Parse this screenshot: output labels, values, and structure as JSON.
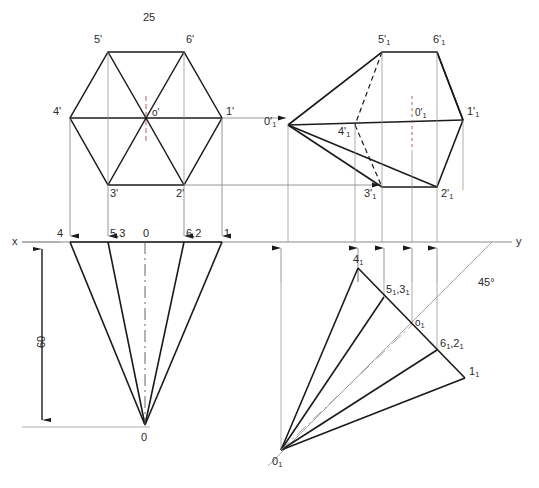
{
  "drawing": {
    "title_dimension": "25",
    "height_dimension": "60",
    "angle_note": "45°",
    "axes": {
      "x_label": "x",
      "y_label": "y",
      "x_axis_y": 242,
      "y_axis_x_end": 512
    },
    "colors": {
      "object_line": "#1a1a1a",
      "thin_line": "#808080",
      "center_line": "#555555",
      "hidden_line": "#1a1a1a",
      "text": "#2b2b2b",
      "background": "#ffffff"
    },
    "views": [
      {
        "name": "front-view-hexagon",
        "type": "hexagon",
        "center": {
          "x": 146,
          "y": 118,
          "label": "o'"
        },
        "vertices": [
          {
            "label": "1'",
            "x": 222,
            "y": 118,
            "lx": 226,
            "ly": 108
          },
          {
            "label": "2'",
            "x": 184,
            "y": 185,
            "lx": 176,
            "ly": 190
          },
          {
            "label": "3'",
            "x": 108,
            "y": 185,
            "lx": 110,
            "ly": 190
          },
          {
            "label": "4'",
            "x": 70,
            "y": 118,
            "lx": 53,
            "ly": 108
          },
          {
            "label": "5'",
            "x": 108,
            "y": 52,
            "lx": 94,
            "ly": 36
          },
          {
            "label": "6'",
            "x": 184,
            "y": 52,
            "lx": 186,
            "ly": 36
          }
        ]
      },
      {
        "name": "top-view-fan-left",
        "type": "cone-fan",
        "apex": {
          "label": "0",
          "x": 145,
          "y": 425,
          "lx": 141,
          "ly": 432
        },
        "base_points": [
          {
            "label": "4",
            "x": 70,
            "y": 242,
            "lx": 57,
            "ly": 228
          },
          {
            "label": "5,3",
            "x": 108,
            "y": 242,
            "lx": 110,
            "ly": 228
          },
          {
            "label": "0",
            "x": 145,
            "y": 242,
            "lx": 143,
            "ly": 228
          },
          {
            "label": "6,2",
            "x": 184,
            "y": 242,
            "lx": 186,
            "ly": 228
          },
          {
            "label": "1",
            "x": 222,
            "y": 242,
            "lx": 224,
            "ly": 228
          }
        ]
      },
      {
        "name": "auxiliary-view-right-upper",
        "type": "rotated-front",
        "apex": {
          "label": "0'1",
          "x": 288,
          "y": 125,
          "lx": 266,
          "ly": 116
        },
        "vertices": [
          {
            "label": "1'1",
            "x": 463,
            "y": 120,
            "lx": 467,
            "ly": 108
          },
          {
            "label": "2'1",
            "x": 437,
            "y": 187,
            "lx": 441,
            "ly": 190
          },
          {
            "label": "3'1",
            "x": 382,
            "y": 187,
            "lx": 366,
            "ly": 190
          },
          {
            "label": "4'1",
            "x": 355,
            "y": 125,
            "lx": 340,
            "ly": 128
          },
          {
            "label": "5'1",
            "x": 382,
            "y": 52,
            "lx": 379,
            "ly": 36
          },
          {
            "label": "6'1",
            "x": 437,
            "y": 52,
            "lx": 434,
            "ly": 36
          }
        ],
        "center_label": {
          "label": "0'1",
          "x": 418,
          "y": 112
        }
      },
      {
        "name": "auxiliary-view-right-lower",
        "type": "rotated-top",
        "apex": {
          "label": "01",
          "x": 281,
          "y": 450,
          "lx": 274,
          "ly": 456
        },
        "points": [
          {
            "label": "41",
            "x": 358,
            "y": 268,
            "lx": 355,
            "ly": 255
          },
          {
            "label": "51,31",
            "x": 384,
            "y": 297,
            "lx": 388,
            "ly": 285
          },
          {
            "label": "o1",
            "x": 412,
            "y": 325,
            "lx": 416,
            "ly": 318
          },
          {
            "label": "61,21",
            "x": 437,
            "y": 350,
            "lx": 441,
            "ly": 340
          },
          {
            "label": "11",
            "x": 465,
            "y": 378,
            "lx": 469,
            "ly": 368
          }
        ]
      }
    ],
    "labels": [
      {
        "name": "dim-25",
        "text": "25",
        "x": 143,
        "y": 12
      },
      {
        "name": "dim-60",
        "text": "60",
        "x": 29,
        "y": 345
      },
      {
        "name": "angle-45",
        "text": "45°",
        "x": 478,
        "y": 277
      },
      {
        "name": "axis-x",
        "text": "x",
        "x": 12,
        "y": 236
      },
      {
        "name": "axis-y",
        "text": "y",
        "x": 516,
        "y": 236
      }
    ]
  }
}
